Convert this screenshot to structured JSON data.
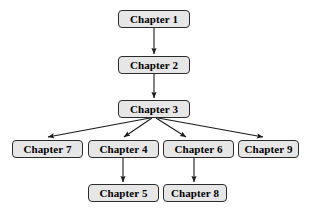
{
  "diagram": {
    "type": "directed-tree",
    "background_color": "#ffffff",
    "node_fill_color": "#e6e6e6",
    "node_border_color": "#2b2b2b",
    "edge_color": "#1a1a1a",
    "text_color": "#000000",
    "nodes": [
      {
        "id": "ch1",
        "label": "Chapter 1",
        "x": 118,
        "y": 10,
        "w": 72,
        "h": 18
      },
      {
        "id": "ch2",
        "label": "Chapter 2",
        "x": 118,
        "y": 56,
        "w": 72,
        "h": 18
      },
      {
        "id": "ch3",
        "label": "Chapter 3",
        "x": 118,
        "y": 100,
        "w": 72,
        "h": 18
      },
      {
        "id": "ch7",
        "label": "Chapter 7",
        "x": 12,
        "y": 140,
        "w": 71,
        "h": 18
      },
      {
        "id": "ch4",
        "label": "Chapter 4",
        "x": 88,
        "y": 140,
        "w": 71,
        "h": 18
      },
      {
        "id": "ch6",
        "label": "Chapter 6",
        "x": 163,
        "y": 140,
        "w": 71,
        "h": 18
      },
      {
        "id": "ch9",
        "label": "Chapter 9",
        "x": 238,
        "y": 140,
        "w": 61,
        "h": 18
      },
      {
        "id": "ch5",
        "label": "Chapter 5",
        "x": 88,
        "y": 184,
        "w": 71,
        "h": 18
      },
      {
        "id": "ch8",
        "label": "Chapter 8",
        "x": 163,
        "y": 184,
        "w": 64,
        "h": 18
      }
    ],
    "edges": [
      {
        "from": "ch1",
        "to": "ch2",
        "x1": 154,
        "y1": 28,
        "x2": 154,
        "y2": 54
      },
      {
        "from": "ch2",
        "to": "ch3",
        "x1": 154,
        "y1": 74,
        "x2": 154,
        "y2": 98
      },
      {
        "from": "ch3",
        "to": "ch7",
        "x1": 150,
        "y1": 118,
        "x2": 48,
        "y2": 137
      },
      {
        "from": "ch3",
        "to": "ch4",
        "x1": 152,
        "y1": 118,
        "x2": 124,
        "y2": 137
      },
      {
        "from": "ch3",
        "to": "ch6",
        "x1": 156,
        "y1": 118,
        "x2": 186,
        "y2": 137
      },
      {
        "from": "ch3",
        "to": "ch9",
        "x1": 158,
        "y1": 118,
        "x2": 263,
        "y2": 137
      },
      {
        "from": "ch4",
        "to": "ch5",
        "x1": 123,
        "y1": 158,
        "x2": 123,
        "y2": 182
      },
      {
        "from": "ch6",
        "to": "ch8",
        "x1": 194,
        "y1": 158,
        "x2": 194,
        "y2": 182
      }
    ]
  }
}
